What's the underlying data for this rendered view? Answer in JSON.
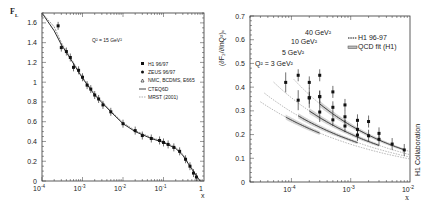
{
  "chart_data": [
    {
      "type": "scatter",
      "title": "Q² = 15 GeV²",
      "xlabel": "x",
      "ylabel": "F_L",
      "xscale": "log",
      "xlim": [
        0.0001,
        1
      ],
      "ylim": [
        0,
        1.7
      ],
      "x_tick_labels": [
        "10^-4",
        "10^-3",
        "10^-2",
        "10^-1",
        "1"
      ],
      "y_tick_labels": [
        "0",
        "0.2",
        "0.4",
        "0.6",
        "0.8",
        "1",
        "1.2",
        "1.4",
        "1.6"
      ],
      "grid": false,
      "legend_position": "center-right",
      "legend": [
        "H1 96/97",
        "ZEUS 96/97",
        "NMC, BCDMS, E665",
        "CTEQ6D",
        "MRST (2001)"
      ],
      "series": [
        {
          "name": "data",
          "x": [
            0.00025,
            0.0003,
            0.0004,
            0.0005,
            0.0006,
            0.0008,
            0.001,
            0.0013,
            0.0016,
            0.002,
            0.0025,
            0.0032,
            0.005,
            0.01,
            0.02,
            0.03,
            0.05,
            0.08,
            0.1,
            0.13,
            0.18,
            0.25,
            0.35,
            0.45,
            0.55,
            0.65
          ],
          "y": [
            1.57,
            1.35,
            1.31,
            1.25,
            1.15,
            1.12,
            1.05,
            0.97,
            0.93,
            0.87,
            0.83,
            0.77,
            0.7,
            0.58,
            0.51,
            0.46,
            0.43,
            0.41,
            0.39,
            0.37,
            0.34,
            0.3,
            0.22,
            0.15,
            0.08,
            0.04
          ]
        },
        {
          "name": "CTEQ6D",
          "x": [
            0.0001,
            0.0002,
            0.0003,
            0.0005,
            0.001,
            0.002,
            0.005,
            0.01,
            0.02,
            0.05,
            0.1,
            0.2,
            0.3,
            0.5,
            0.8
          ],
          "y": [
            1.72,
            1.52,
            1.38,
            1.24,
            1.04,
            0.87,
            0.7,
            0.58,
            0.5,
            0.43,
            0.39,
            0.33,
            0.26,
            0.12,
            0.0
          ]
        },
        {
          "name": "MRST (2001)",
          "x": [
            0.0001,
            0.0002,
            0.0003,
            0.0005,
            0.001,
            0.002,
            0.005,
            0.01,
            0.02,
            0.05,
            0.1,
            0.2,
            0.3,
            0.5,
            0.8
          ],
          "y": [
            1.75,
            1.56,
            1.4,
            1.25,
            1.05,
            0.88,
            0.71,
            0.59,
            0.51,
            0.44,
            0.4,
            0.34,
            0.27,
            0.13,
            0.0
          ]
        }
      ]
    },
    {
      "type": "scatter",
      "title": "",
      "xlabel": "x",
      "ylabel": "(∂F₂/∂lnQ²)ₓ",
      "xscale": "log",
      "xlim": [
        2e-05,
        0.01
      ],
      "ylim": [
        0,
        0.7
      ],
      "x_tick_labels": [
        "10^-4",
        "10^-3",
        "10^-2"
      ],
      "y_tick_labels": [
        "0",
        "0.1",
        "0.2",
        "0.3",
        "0.4",
        "0.5",
        "0.6",
        "0.7"
      ],
      "grid": false,
      "legend_position": "upper-right",
      "legend": [
        "H1 96-97",
        "QCD fit (H1)"
      ],
      "annotations": [
        "Q² = 3 GeV²",
        "5 GeV²",
        "10 GeV²",
        "40 GeV²",
        "H1 Collaboration"
      ],
      "series": [
        {
          "name": "Q²=3 GeV²",
          "x": [
            8e-05,
            0.00013,
            0.0002,
            0.0003
          ],
          "y": [
            0.42,
            0.345,
            0.355,
            0.295
          ]
        },
        {
          "name": "Q²=5 GeV²",
          "x": [
            0.00013,
            0.0002,
            0.0003,
            0.0005,
            0.0008,
            0.0013
          ],
          "y": [
            0.45,
            0.355,
            0.36,
            0.262,
            0.236,
            0.198
          ]
        },
        {
          "name": "Q²=10 GeV²",
          "x": [
            0.0002,
            0.0003,
            0.0005,
            0.0008,
            0.0013,
            0.002,
            0.003
          ],
          "y": [
            0.42,
            0.36,
            0.315,
            0.275,
            0.222,
            0.195,
            0.18
          ]
        },
        {
          "name": "Q²=40 GeV²",
          "x": [
            0.0003,
            0.0005,
            0.0008,
            0.0013,
            0.002,
            0.003,
            0.005,
            0.008
          ],
          "y": [
            0.45,
            0.38,
            0.325,
            0.26,
            0.255,
            0.205,
            0.16,
            0.135
          ]
        }
      ]
    }
  ],
  "left": {
    "ylabel": "F",
    "ylabel_sub": "L",
    "title": "Q² = 15 GeV²",
    "xlabel": "x",
    "x_ticks": [
      {
        "base": "10",
        "exp": "-4"
      },
      {
        "base": "10",
        "exp": "-3"
      },
      {
        "base": "10",
        "exp": "-2"
      },
      {
        "base": "10",
        "exp": "-1"
      },
      {
        "base": "1",
        "exp": ""
      }
    ],
    "y_ticks": [
      "0",
      "0.2",
      "0.4",
      "0.6",
      "0.8",
      "1",
      "1.2",
      "1.4",
      "1.6"
    ],
    "legend": [
      "H1 96/97",
      "ZEUS 96/97",
      "NMC, BCDMS, E665",
      "CTEQ6D",
      "MRST (2001)"
    ]
  },
  "right": {
    "ylabel": "(∂F₂/∂lnQ²)ₓ",
    "xlabel": "x",
    "x_ticks": [
      {
        "base": "10",
        "exp": "-4"
      },
      {
        "base": "10",
        "exp": "-3"
      },
      {
        "base": "10",
        "exp": "-2"
      }
    ],
    "y_ticks": [
      "0",
      "0.1",
      "0.2",
      "0.3",
      "0.4",
      "0.5",
      "0.6",
      "0.7"
    ],
    "legend": [
      "H1 96-97",
      "QCD fit (H1)"
    ],
    "curve_labels": [
      "Q² = 3 GeV²",
      "5 GeV²",
      "10 GeV²",
      "40 GeV²"
    ],
    "collab": "H1 Collaboration"
  }
}
